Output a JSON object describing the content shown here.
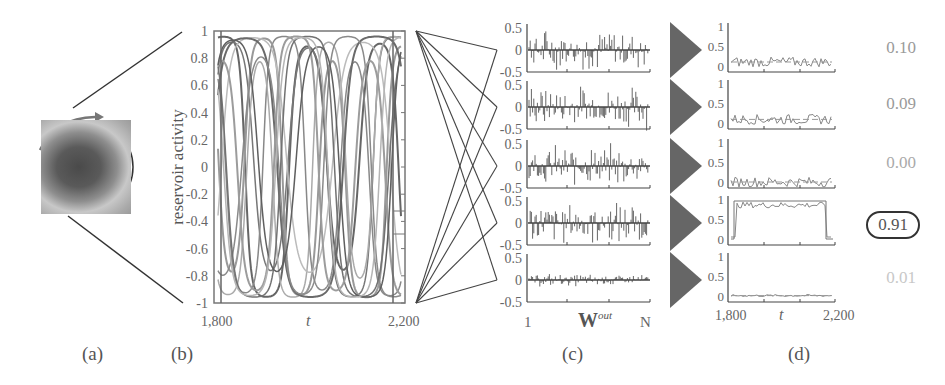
{
  "panels": {
    "a": {
      "label": "(a)",
      "description": "grayscale image patch with circular scan path and rotation arrow"
    },
    "b": {
      "label": "(b)",
      "ylabel": "reservoir activity",
      "xlabel": "t",
      "x_start": "1,800",
      "x_end": "2,200"
    },
    "c": {
      "label": "(c)",
      "xlabel": "W",
      "xlabel_sup": "out",
      "x_start": "1",
      "x_end": "N"
    },
    "d": {
      "label": "(d)",
      "xlabel": "t",
      "x_start": "1,800",
      "x_end": "2,200"
    }
  },
  "scores": [
    {
      "value": "0.10",
      "color": "#9a9a9a",
      "highlighted": false
    },
    {
      "value": "0.09",
      "color": "#9a9a9a",
      "highlighted": false
    },
    {
      "value": "0.00",
      "color": "#b0b0b0",
      "highlighted": false
    },
    {
      "value": "0.91",
      "color": "#555555",
      "highlighted": true
    },
    {
      "value": "0.01",
      "color": "#c8c8c8",
      "highlighted": false
    }
  ],
  "chart_data": [
    {
      "type": "line",
      "title": "(b) reservoir activity",
      "xlabel": "t",
      "ylabel": "reservoir activity",
      "xlim": [
        1800,
        2200
      ],
      "ylim": [
        -1,
        1
      ],
      "x_tick_labels": [
        "1,800",
        "2,200"
      ],
      "y_tick_labels": [
        "1",
        "0.8",
        "0.6",
        "0.4",
        "0.2",
        "0",
        "-0.2",
        "-0.4",
        "-0.6",
        "-0.8",
        "-1"
      ],
      "series_description": "many overlapping gray oscillating traces saturating between -1 and 1"
    },
    {
      "type": "bar",
      "title": "(c) output weights W^out (5 readouts)",
      "xlabel": "W^out",
      "x_tick_labels": [
        "1",
        "N"
      ],
      "ylim": [
        -0.5,
        0.5
      ],
      "y_tick_labels": [
        "0.5",
        "0",
        "-0.5"
      ],
      "rows": 5,
      "row_amplitudes": [
        0.5,
        0.5,
        0.5,
        0.5,
        0.15
      ]
    },
    {
      "type": "line",
      "title": "(d) readout outputs",
      "xlabel": "t",
      "xlim": [
        1800,
        2200
      ],
      "ylim": [
        0,
        1
      ],
      "y_tick_labels": [
        "1",
        "0.5",
        "0"
      ],
      "x_tick_labels": [
        "1,800",
        "2,200"
      ],
      "series": [
        {
          "name": "readout 1",
          "mean_level": 0.1,
          "score": 0.1
        },
        {
          "name": "readout 2",
          "mean_level": 0.09,
          "score": 0.09
        },
        {
          "name": "readout 3",
          "mean_level": 0.0,
          "score": 0.0
        },
        {
          "name": "readout 4",
          "mean_level": 0.91,
          "score": 0.91
        },
        {
          "name": "readout 5",
          "mean_level": 0.01,
          "score": 0.01
        }
      ]
    }
  ]
}
